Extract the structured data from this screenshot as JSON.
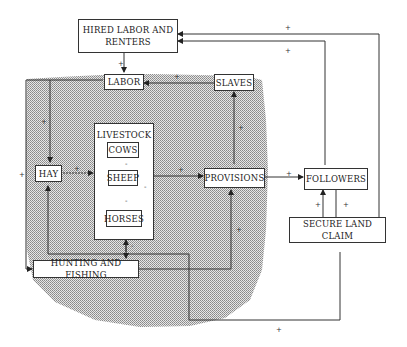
{
  "diagram": {
    "type": "causal-loop",
    "nodes": {
      "hired_labor": "HIRED LABOR AND RENTERS",
      "labor": "LABOR",
      "slaves": "SLAVES",
      "livestock": "LIVESTOCK",
      "cows": "COWS",
      "sheep": "SHEEP",
      "horses": "HORSES",
      "hay": "HAY",
      "provisions": "PROVISIONS",
      "followers": "FOLLOWERS",
      "secure_land_claim": "SECURE LAND CLAIM",
      "hunting_fishing": "HUNTING AND FISHING"
    },
    "hired_lines": [
      "HIRED LABOR AND",
      "RENTERS"
    ],
    "signs": {
      "plus": "+",
      "minus": "-"
    },
    "colors": {
      "line": "#333333",
      "shade": "#c8c8c8",
      "box_fill": "#ffffff"
    },
    "edges": [
      {
        "from": "HIRED LABOR AND RENTERS",
        "to": "LABOR",
        "sign": "+"
      },
      {
        "from": "SLAVES",
        "to": "LABOR",
        "sign": "+"
      },
      {
        "from": "LABOR",
        "to": "HAY",
        "sign": "+"
      },
      {
        "from": "HAY",
        "to": "LIVESTOCK",
        "sign": "+"
      },
      {
        "from": "COWS",
        "to": "SHEEP",
        "sign": "-"
      },
      {
        "from": "SHEEP",
        "to": "HORSES",
        "sign": "-"
      },
      {
        "from": "COWS",
        "to": "HORSES",
        "sign": "-"
      },
      {
        "from": "LIVESTOCK",
        "to": "PROVISIONS",
        "sign": "+"
      },
      {
        "from": "PROVISIONS",
        "to": "SLAVES",
        "sign": "+"
      },
      {
        "from": "PROVISIONS",
        "to": "FOLLOWERS",
        "sign": "+"
      },
      {
        "from": "FOLLOWERS",
        "to": "HIRED LABOR AND RENTERS",
        "sign": "+"
      },
      {
        "from": "SECURE LAND CLAIM",
        "to": "HIRED LABOR AND RENTERS",
        "sign": "+"
      },
      {
        "from": "SECURE LAND CLAIM",
        "to": "FOLLOWERS",
        "sign": "+"
      },
      {
        "from": "FOLLOWERS",
        "to": "SECURE LAND CLAIM",
        "sign": "+"
      },
      {
        "from": "LABOR",
        "to": "HUNTING AND FISHING",
        "sign": "+"
      },
      {
        "from": "HUNTING AND FISHING",
        "to": "PROVISIONS",
        "sign": "+"
      },
      {
        "from": "HUNTING AND FISHING",
        "to": "LIVESTOCK",
        "sign": "-"
      },
      {
        "from": "SECURE LAND CLAIM",
        "to": "HAY",
        "sign": "+"
      }
    ]
  }
}
